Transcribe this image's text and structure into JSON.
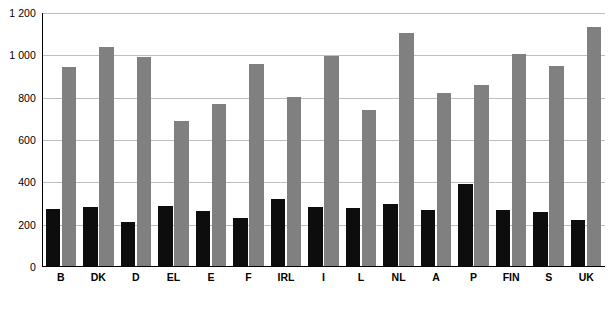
{
  "chart_data": {
    "type": "bar",
    "title": "",
    "subtitle": "",
    "xlabel": "",
    "ylabel": "",
    "ylim": [
      0,
      1200
    ],
    "ytick_step": 200,
    "ytick_labels": [
      "1 200",
      "1 000",
      "800",
      "600",
      "400",
      "200",
      "0"
    ],
    "ytick_values": [
      1200,
      1000,
      800,
      600,
      400,
      200,
      0
    ],
    "grid": true,
    "legend": null,
    "legend_position": "none",
    "categories": [
      "B",
      "DK",
      "D",
      "EL",
      "E",
      "F",
      "IRL",
      "I",
      "L",
      "NL",
      "A",
      "P",
      "FIN",
      "S",
      "UK"
    ],
    "series": [
      {
        "name": "series-1",
        "color": "#0d0d0d",
        "values": [
          275,
          285,
          215,
          290,
          265,
          230,
          320,
          285,
          280,
          300,
          270,
          390,
          268,
          260,
          220
        ]
      },
      {
        "name": "series-2",
        "color": "#808080",
        "values": [
          945,
          1040,
          990,
          690,
          770,
          960,
          805,
          995,
          740,
          1105,
          820,
          860,
          1005,
          950,
          1135
        ]
      }
    ]
  },
  "colors": {
    "background": "#ffffff",
    "gridline": "#bdbdbd",
    "axis": "#000000",
    "series_1": "#0d0d0d",
    "series_2": "#808080",
    "text": "#000000"
  }
}
